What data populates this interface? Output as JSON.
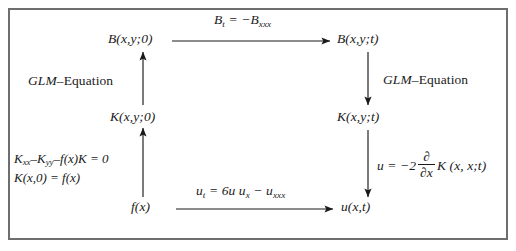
{
  "diagram": {
    "type": "commutative-diagram",
    "frame_color": "#6e6e6e",
    "background": "#ffffff",
    "text_color": "#1a1a1a",
    "nodes": [
      {
        "id": "B_initial",
        "label": "B(x,y;0)",
        "position": "top-left"
      },
      {
        "id": "B_time",
        "label": "B(x,y;t)",
        "position": "top-right"
      },
      {
        "id": "K_initial",
        "label": "K(x,y;0)",
        "position": "middle-left"
      },
      {
        "id": "K_time",
        "label": "K(x,y;t)",
        "position": "middle-right"
      },
      {
        "id": "f_initial",
        "label": "f(x)",
        "position": "bottom-left"
      },
      {
        "id": "u_solution",
        "label": "u(x,t)",
        "position": "bottom-right"
      }
    ],
    "edges": {
      "top": {
        "from": "B_initial",
        "to": "B_time",
        "direction": "right",
        "label_main": "B",
        "label_sub1": "t",
        "label_rel": " = −B",
        "label_sub2": "xxx"
      },
      "bottom": {
        "from": "f_initial",
        "to": "u_solution",
        "direction": "right",
        "label_u": "u",
        "label_sub_t": "t",
        "label_rel": " = 6u u",
        "label_sub_x": "x",
        "label_minus": " − u",
        "label_sub_xxx": "xxx"
      },
      "left_lower": {
        "from": "f_initial",
        "to": "K_initial",
        "direction": "up",
        "label": ""
      },
      "left_upper": {
        "from": "K_initial",
        "to": "B_initial",
        "direction": "up",
        "label_italic": "GLM",
        "label_upright": "–Equation"
      },
      "right_upper": {
        "from": "B_time",
        "to": "K_time",
        "direction": "down",
        "label_italic": "GLM",
        "label_upright": "–Equation"
      },
      "right_lower": {
        "from": "K_time",
        "to": "u_solution",
        "direction": "down",
        "label_lhs": "u = −2",
        "label_num": "∂",
        "label_den": "∂x",
        "label_rhs": "K (x, x;t)"
      }
    },
    "left_equations": {
      "line1_lhs": "K",
      "line1_sub1": "xx",
      "line1_mid": "–K",
      "line1_sub2": "yy",
      "line1_rest": "–f(x)K = 0",
      "line2": "K(x,0) = f(x)"
    }
  }
}
